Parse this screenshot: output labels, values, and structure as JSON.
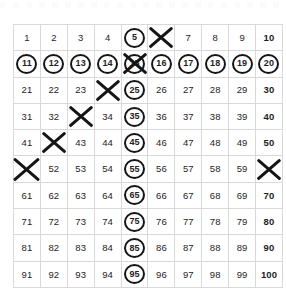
{
  "page": {
    "background_color": "#ffffff",
    "grid_line_color": "#d9d9dd",
    "mark_color": "#151517",
    "text_color": "#1d1d1f"
  },
  "grid": {
    "rows": 10,
    "columns": 10,
    "start_number": 1,
    "end_number": 100,
    "cells": [
      [
        {
          "value": "1",
          "circled": false,
          "crossed": false,
          "bold": false
        },
        {
          "value": "2",
          "circled": false,
          "crossed": false,
          "bold": false
        },
        {
          "value": "3",
          "circled": false,
          "crossed": false,
          "bold": false
        },
        {
          "value": "4",
          "circled": false,
          "crossed": false,
          "bold": false
        },
        {
          "value": "5",
          "circled": true,
          "crossed": false,
          "bold": false
        },
        {
          "value": "6",
          "circled": false,
          "crossed": true,
          "bold": false
        },
        {
          "value": "7",
          "circled": false,
          "crossed": false,
          "bold": false
        },
        {
          "value": "8",
          "circled": false,
          "crossed": false,
          "bold": false
        },
        {
          "value": "9",
          "circled": false,
          "crossed": false,
          "bold": false
        },
        {
          "value": "10",
          "circled": false,
          "crossed": false,
          "bold": true
        }
      ],
      [
        {
          "value": "11",
          "circled": true,
          "crossed": false,
          "bold": true
        },
        {
          "value": "12",
          "circled": true,
          "crossed": false,
          "bold": true
        },
        {
          "value": "13",
          "circled": true,
          "crossed": false,
          "bold": true
        },
        {
          "value": "14",
          "circled": true,
          "crossed": false,
          "bold": true
        },
        {
          "value": "15",
          "circled": true,
          "crossed": true,
          "bold": true
        },
        {
          "value": "16",
          "circled": true,
          "crossed": false,
          "bold": true
        },
        {
          "value": "17",
          "circled": true,
          "crossed": false,
          "bold": true
        },
        {
          "value": "18",
          "circled": true,
          "crossed": false,
          "bold": true
        },
        {
          "value": "19",
          "circled": true,
          "crossed": false,
          "bold": true
        },
        {
          "value": "20",
          "circled": true,
          "crossed": false,
          "bold": true
        }
      ],
      [
        {
          "value": "21",
          "circled": false,
          "crossed": false,
          "bold": false
        },
        {
          "value": "22",
          "circled": false,
          "crossed": false,
          "bold": false
        },
        {
          "value": "23",
          "circled": false,
          "crossed": false,
          "bold": false
        },
        {
          "value": "24",
          "circled": false,
          "crossed": true,
          "bold": false
        },
        {
          "value": "25",
          "circled": true,
          "crossed": false,
          "bold": false
        },
        {
          "value": "26",
          "circled": false,
          "crossed": false,
          "bold": false
        },
        {
          "value": "27",
          "circled": false,
          "crossed": false,
          "bold": false
        },
        {
          "value": "28",
          "circled": false,
          "crossed": false,
          "bold": false
        },
        {
          "value": "29",
          "circled": false,
          "crossed": false,
          "bold": false
        },
        {
          "value": "30",
          "circled": false,
          "crossed": false,
          "bold": true
        }
      ],
      [
        {
          "value": "31",
          "circled": false,
          "crossed": false,
          "bold": false
        },
        {
          "value": "32",
          "circled": false,
          "crossed": false,
          "bold": false
        },
        {
          "value": "33",
          "circled": false,
          "crossed": true,
          "bold": false
        },
        {
          "value": "34",
          "circled": false,
          "crossed": false,
          "bold": false
        },
        {
          "value": "35",
          "circled": true,
          "crossed": false,
          "bold": false
        },
        {
          "value": "36",
          "circled": false,
          "crossed": false,
          "bold": false
        },
        {
          "value": "37",
          "circled": false,
          "crossed": false,
          "bold": false
        },
        {
          "value": "38",
          "circled": false,
          "crossed": false,
          "bold": false
        },
        {
          "value": "39",
          "circled": false,
          "crossed": false,
          "bold": false
        },
        {
          "value": "40",
          "circled": false,
          "crossed": false,
          "bold": true
        }
      ],
      [
        {
          "value": "41",
          "circled": false,
          "crossed": false,
          "bold": false
        },
        {
          "value": "42",
          "circled": false,
          "crossed": true,
          "bold": false
        },
        {
          "value": "43",
          "circled": false,
          "crossed": false,
          "bold": false
        },
        {
          "value": "44",
          "circled": false,
          "crossed": false,
          "bold": false
        },
        {
          "value": "45",
          "circled": true,
          "crossed": false,
          "bold": false
        },
        {
          "value": "46",
          "circled": false,
          "crossed": false,
          "bold": false
        },
        {
          "value": "47",
          "circled": false,
          "crossed": false,
          "bold": false
        },
        {
          "value": "48",
          "circled": false,
          "crossed": false,
          "bold": false
        },
        {
          "value": "49",
          "circled": false,
          "crossed": false,
          "bold": false
        },
        {
          "value": "50",
          "circled": false,
          "crossed": false,
          "bold": true
        }
      ],
      [
        {
          "value": "51",
          "circled": false,
          "crossed": true,
          "bold": false
        },
        {
          "value": "52",
          "circled": false,
          "crossed": false,
          "bold": false
        },
        {
          "value": "53",
          "circled": false,
          "crossed": false,
          "bold": false
        },
        {
          "value": "54",
          "circled": false,
          "crossed": false,
          "bold": false
        },
        {
          "value": "55",
          "circled": true,
          "crossed": false,
          "bold": false
        },
        {
          "value": "56",
          "circled": false,
          "crossed": false,
          "bold": false
        },
        {
          "value": "57",
          "circled": false,
          "crossed": false,
          "bold": false
        },
        {
          "value": "58",
          "circled": false,
          "crossed": false,
          "bold": false
        },
        {
          "value": "59",
          "circled": false,
          "crossed": false,
          "bold": false
        },
        {
          "value": "60",
          "circled": false,
          "crossed": true,
          "bold": true
        }
      ],
      [
        {
          "value": "61",
          "circled": false,
          "crossed": false,
          "bold": false
        },
        {
          "value": "62",
          "circled": false,
          "crossed": false,
          "bold": false
        },
        {
          "value": "63",
          "circled": false,
          "crossed": false,
          "bold": false
        },
        {
          "value": "64",
          "circled": false,
          "crossed": false,
          "bold": false
        },
        {
          "value": "65",
          "circled": true,
          "crossed": false,
          "bold": false
        },
        {
          "value": "66",
          "circled": false,
          "crossed": false,
          "bold": false
        },
        {
          "value": "67",
          "circled": false,
          "crossed": false,
          "bold": false
        },
        {
          "value": "68",
          "circled": false,
          "crossed": false,
          "bold": false
        },
        {
          "value": "69",
          "circled": false,
          "crossed": false,
          "bold": false
        },
        {
          "value": "70",
          "circled": false,
          "crossed": false,
          "bold": true
        }
      ],
      [
        {
          "value": "71",
          "circled": false,
          "crossed": false,
          "bold": false
        },
        {
          "value": "72",
          "circled": false,
          "crossed": false,
          "bold": false
        },
        {
          "value": "73",
          "circled": false,
          "crossed": false,
          "bold": false
        },
        {
          "value": "74",
          "circled": false,
          "crossed": false,
          "bold": false
        },
        {
          "value": "75",
          "circled": true,
          "crossed": false,
          "bold": false
        },
        {
          "value": "76",
          "circled": false,
          "crossed": false,
          "bold": false
        },
        {
          "value": "77",
          "circled": false,
          "crossed": false,
          "bold": false
        },
        {
          "value": "78",
          "circled": false,
          "crossed": false,
          "bold": false
        },
        {
          "value": "79",
          "circled": false,
          "crossed": false,
          "bold": false
        },
        {
          "value": "80",
          "circled": false,
          "crossed": false,
          "bold": true
        }
      ],
      [
        {
          "value": "81",
          "circled": false,
          "crossed": false,
          "bold": false
        },
        {
          "value": "82",
          "circled": false,
          "crossed": false,
          "bold": false
        },
        {
          "value": "83",
          "circled": false,
          "crossed": false,
          "bold": false
        },
        {
          "value": "84",
          "circled": false,
          "crossed": false,
          "bold": false
        },
        {
          "value": "85",
          "circled": true,
          "crossed": false,
          "bold": false
        },
        {
          "value": "86",
          "circled": false,
          "crossed": false,
          "bold": false
        },
        {
          "value": "87",
          "circled": false,
          "crossed": false,
          "bold": false
        },
        {
          "value": "88",
          "circled": false,
          "crossed": false,
          "bold": false
        },
        {
          "value": "89",
          "circled": false,
          "crossed": false,
          "bold": false
        },
        {
          "value": "90",
          "circled": false,
          "crossed": false,
          "bold": true
        }
      ],
      [
        {
          "value": "91",
          "circled": false,
          "crossed": false,
          "bold": false
        },
        {
          "value": "92",
          "circled": false,
          "crossed": false,
          "bold": false
        },
        {
          "value": "93",
          "circled": false,
          "crossed": false,
          "bold": false
        },
        {
          "value": "94",
          "circled": false,
          "crossed": false,
          "bold": false
        },
        {
          "value": "95",
          "circled": true,
          "crossed": false,
          "bold": false
        },
        {
          "value": "96",
          "circled": false,
          "crossed": false,
          "bold": false
        },
        {
          "value": "97",
          "circled": false,
          "crossed": false,
          "bold": false
        },
        {
          "value": "98",
          "circled": false,
          "crossed": false,
          "bold": false
        },
        {
          "value": "99",
          "circled": false,
          "crossed": false,
          "bold": false
        },
        {
          "value": "100",
          "circled": false,
          "crossed": false,
          "bold": true
        }
      ]
    ]
  },
  "annotations": {
    "circled_numbers": [
      5,
      11,
      12,
      13,
      14,
      15,
      16,
      17,
      18,
      19,
      20,
      25,
      35,
      45,
      55,
      65,
      75,
      85,
      95
    ],
    "crossed_numbers": [
      6,
      15,
      24,
      33,
      42,
      51,
      60
    ],
    "bold_numbers": [
      10,
      11,
      12,
      13,
      14,
      15,
      16,
      17,
      18,
      19,
      20,
      30,
      40,
      50,
      60,
      70,
      80,
      90,
      100
    ]
  }
}
